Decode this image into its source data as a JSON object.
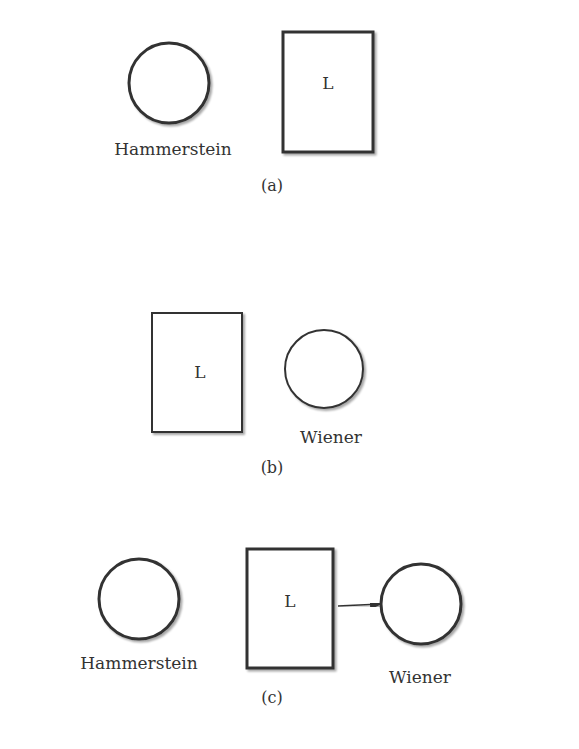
{
  "diagrams": [
    {
      "caption": "(a)",
      "blocks": [
        {
          "type": "circle",
          "label": "Hammerstein"
        },
        {
          "type": "box",
          "label": "L"
        }
      ]
    },
    {
      "caption": "(b)",
      "blocks": [
        {
          "type": "box",
          "label": "L"
        },
        {
          "type": "circle",
          "label": "Wiener"
        }
      ]
    },
    {
      "caption": "(c)",
      "blocks": [
        {
          "type": "circle",
          "label": "Hammerstein"
        },
        {
          "type": "box",
          "label": "L"
        },
        {
          "type": "circle",
          "label": "Wiener"
        }
      ]
    }
  ],
  "colors": {
    "stroke": "#333333",
    "background": "#ffffff"
  }
}
